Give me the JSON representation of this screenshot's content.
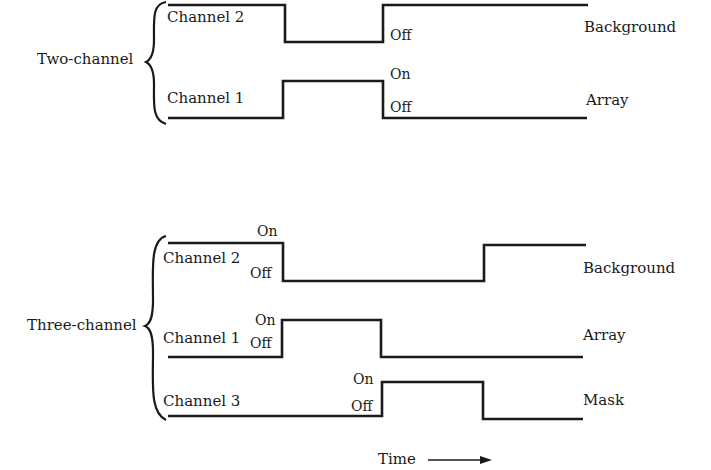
{
  "two_channel": {
    "group_label": "Two-channel",
    "channel2": {
      "label": "Channel 2",
      "off_label": "Off",
      "signal": "Background"
    },
    "channel1": {
      "label": "Channel 1",
      "on_label": "On",
      "off_label": "Off",
      "signal": "Array"
    }
  },
  "three_channel": {
    "group_label": "Three-channel",
    "channel2": {
      "label": "Channel 2",
      "on_label": "On",
      "off_label": "Off",
      "signal": "Background"
    },
    "channel1": {
      "label": "Channel 1",
      "on_label": "On",
      "off_label": "Off",
      "signal": "Array"
    },
    "channel3": {
      "label": "Channel 3",
      "on_label": "On",
      "off_label": "Off",
      "signal": "Mask"
    }
  },
  "time_axis": {
    "label": "Time"
  },
  "colors": {
    "line": "#1a1a1a",
    "background": "#ffffff"
  }
}
